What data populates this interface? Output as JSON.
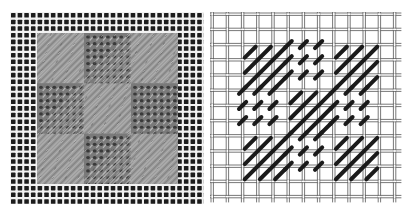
{
  "figure": {
    "panels": [
      {
        "id": "photo",
        "kind": "photograph of stitched canvas",
        "canvas": {
          "background_color": "#1c1c1c",
          "thread_color": "#f2f2f2",
          "pitch_px": 6.65
        },
        "stitched_area": {
          "x": 27,
          "y": 21,
          "width": 141,
          "height": 151,
          "base_color": "#8c8c8c",
          "satin_block_color": "#9a9a9a",
          "tent_block_color": "#7a7a7a",
          "dot_color": "#3a3a3a"
        }
      },
      {
        "id": "diagram",
        "kind": "line diagram of stitch pattern",
        "grid": {
          "threads": 13,
          "pitch_px": 15.2,
          "origin_x": 2,
          "origin_y": 3,
          "thread_gap_px": 2.4,
          "line_color": "#555555"
        },
        "stitch_color": "#1a1a1a",
        "pattern": {
          "block_size_cells": 3,
          "blocks": [
            [
              "scotch",
              "tent",
              "scotch"
            ],
            [
              "tent",
              "scotch",
              "tent"
            ],
            [
              "scotch",
              "tent",
              "scotch"
            ]
          ],
          "start_thread": 2
        }
      }
    ],
    "legend": {
      "scotch": "diagonal satin (Scotch) stitch over 3x3 block",
      "tent": "tent stitch, one per intersection"
    }
  }
}
